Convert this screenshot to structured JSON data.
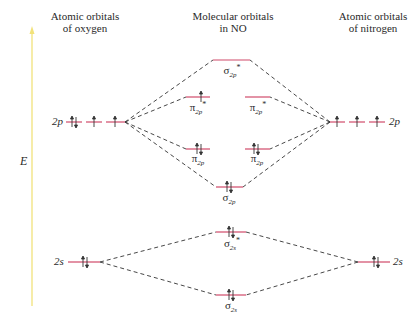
{
  "headers": {
    "left_line1": "Atomic orbitals",
    "left_line2": "of oxygen",
    "center_line1": "Molecular orbitals",
    "center_line2": "in NO",
    "right_line1": "Atomic orbitals",
    "right_line2": "of nitrogen"
  },
  "axis": {
    "label": "E",
    "color": "#f2e27a"
  },
  "colors": {
    "orbital_line": "#d04a6a",
    "dashed_line": "#333333",
    "electron": "#333333"
  },
  "atomic_orbitals": {
    "oxygen": [
      {
        "name": "2p",
        "label": "2p",
        "electrons": [
          "↑↓",
          "↑",
          "↑"
        ]
      },
      {
        "name": "2s",
        "label": "2s",
        "electrons": [
          "↑↓"
        ]
      }
    ],
    "nitrogen": [
      {
        "name": "2p",
        "label": "2p",
        "electrons": [
          "↑",
          "↑",
          "↑"
        ]
      },
      {
        "name": "2s",
        "label": "2s",
        "electrons": [
          "↑↓"
        ]
      }
    ]
  },
  "molecular_orbitals": [
    {
      "id": "sigma2p_star",
      "symbol": "σ",
      "sub": "2p",
      "sup": "*",
      "electrons": ""
    },
    {
      "id": "pi2p_star_a",
      "symbol": "π",
      "sub": "2p",
      "sup": "*",
      "electrons": "↑"
    },
    {
      "id": "pi2p_star_b",
      "symbol": "π",
      "sub": "2p",
      "sup": "*",
      "electrons": ""
    },
    {
      "id": "pi2p_a",
      "symbol": "π",
      "sub": "2p",
      "sup": "",
      "electrons": "↑↓"
    },
    {
      "id": "pi2p_b",
      "symbol": "π",
      "sub": "2p",
      "sup": "",
      "electrons": "↑↓"
    },
    {
      "id": "sigma2p",
      "symbol": "σ",
      "sub": "2p",
      "sup": "",
      "electrons": "↑↓"
    },
    {
      "id": "sigma2s_star",
      "symbol": "σ",
      "sub": "2s",
      "sup": "*",
      "electrons": "↑↓"
    },
    {
      "id": "sigma2s",
      "symbol": "σ",
      "sub": "2s",
      "sup": "",
      "electrons": "↑↓"
    }
  ]
}
